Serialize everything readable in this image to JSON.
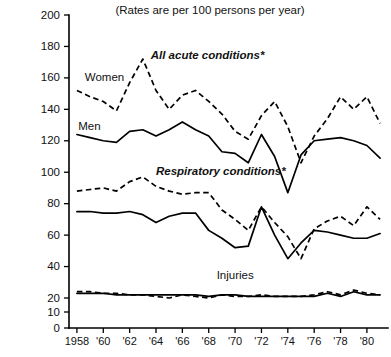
{
  "chart_data": {
    "type": "line",
    "title": "(Rates are per 100 persons per year)",
    "xlabel": "",
    "ylabel": "",
    "grid": false,
    "legend_position": "inline-annotations",
    "x": [
      1958,
      1959,
      1960,
      1961,
      1962,
      1963,
      1964,
      1965,
      1966,
      1967,
      1968,
      1969,
      1970,
      1971,
      1972,
      1973,
      1974,
      1975,
      1976,
      1977,
      1978,
      1979,
      1980,
      1981
    ],
    "xlim": [
      1957.4,
      1981.6
    ],
    "ylim": [
      0,
      200
    ],
    "xtick_labels": [
      "1958",
      "'60",
      "'62",
      "'64",
      "'66",
      "'68",
      "'70",
      "'72",
      "'74",
      "'76",
      "'78",
      "'80"
    ],
    "xtick_values": [
      1958,
      1960,
      1962,
      1964,
      1966,
      1968,
      1970,
      1972,
      1974,
      1976,
      1978,
      1980
    ],
    "ytick_labels": [
      "0",
      "10",
      "20",
      "40",
      "60",
      "80",
      "100",
      "120",
      "140",
      "160",
      "180",
      "200"
    ],
    "ytick_values": [
      0,
      10,
      20,
      40,
      60,
      80,
      100,
      120,
      140,
      160,
      180,
      200
    ],
    "y_axis_note": "non-linear break between 20 and 40",
    "annotations": [
      {
        "text": "All acute conditions*",
        "x": 1963.6,
        "y": 172,
        "style": "italic-bold"
      },
      {
        "text": "Respiratory conditions*",
        "x": 1964.0,
        "y": 98,
        "style": "italic-bold"
      },
      {
        "text": "Injuries",
        "x": 1968.6,
        "y": 32,
        "style": "plain"
      },
      {
        "text": "Women",
        "x": 1958.6,
        "y": 158,
        "style": "plain"
      },
      {
        "text": "Men",
        "x": 1958.1,
        "y": 127,
        "style": "plain"
      }
    ],
    "series": [
      {
        "name": "All acute conditions - Women",
        "group": "All acute conditions*",
        "sex": "Women",
        "linestyle": "dashed",
        "values": [
          152,
          148,
          145,
          139,
          157,
          172,
          152,
          140,
          149,
          152,
          145,
          137,
          126,
          121,
          136,
          145,
          129,
          106,
          123,
          134,
          148,
          140,
          148,
          131
        ]
      },
      {
        "name": "All acute conditions - Men",
        "group": "All acute conditions*",
        "sex": "Men",
        "linestyle": "solid",
        "values": [
          124,
          122,
          120,
          119,
          126,
          127,
          123,
          127,
          132,
          127,
          123,
          113,
          112,
          106,
          124,
          110,
          87,
          111,
          120,
          121,
          122,
          120,
          117,
          109
        ]
      },
      {
        "name": "Respiratory conditions - Women",
        "group": "Respiratory conditions*",
        "sex": "Women",
        "linestyle": "dashed",
        "values": [
          88,
          89,
          90,
          88,
          94,
          97,
          91,
          88,
          86,
          87,
          87,
          76,
          70,
          63,
          78,
          68,
          59,
          45,
          64,
          69,
          72,
          66,
          78,
          70
        ]
      },
      {
        "name": "Respiratory conditions - Men",
        "group": "Respiratory conditions*",
        "sex": "Men",
        "linestyle": "solid",
        "values": [
          75,
          75,
          74,
          74,
          75,
          73,
          68,
          72,
          74,
          74,
          63,
          58,
          52,
          53,
          78,
          60,
          45,
          55,
          63,
          62,
          60,
          58,
          58,
          61
        ]
      },
      {
        "name": "Injuries - Women",
        "group": "Injuries",
        "sex": "Women",
        "linestyle": "dashed",
        "values": [
          24,
          24,
          23,
          23,
          22,
          22,
          21,
          20,
          22,
          21,
          20,
          22,
          21,
          21,
          22,
          21,
          21,
          21,
          22,
          24,
          22,
          25,
          23,
          22
        ]
      },
      {
        "name": "Injuries - Men",
        "group": "Injuries",
        "sex": "Men",
        "linestyle": "solid",
        "values": [
          23,
          23,
          23,
          22,
          22,
          22,
          22,
          22,
          22,
          22,
          21,
          22,
          22,
          21,
          21,
          21,
          21,
          21,
          21,
          23,
          21,
          24,
          22,
          22
        ]
      }
    ]
  }
}
